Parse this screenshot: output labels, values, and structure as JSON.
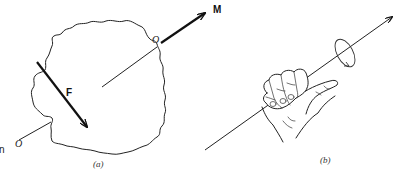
{
  "figure": {
    "panel_a": {
      "caption": "(a)",
      "force_label": "F",
      "moment_label": "M",
      "point_label_top": "O",
      "point_label_bottom": "O",
      "edge_label": "n"
    },
    "panel_b": {
      "caption": "(b)"
    }
  }
}
